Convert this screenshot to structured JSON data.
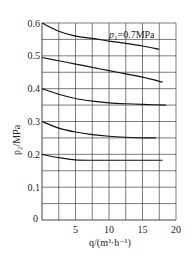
{
  "chart_data": {
    "type": "line",
    "title": "",
    "xlabel": "q/(m³·h⁻¹)",
    "ylabel": "p₂/MPa",
    "xlim": [
      0,
      20
    ],
    "ylim": [
      0,
      0.6
    ],
    "grid": true,
    "x_grid_step": 2.5,
    "y_grid_step": 0.05,
    "x_ticks": [
      {
        "value": 0,
        "label": "0"
      },
      {
        "value": 5,
        "label": "5"
      },
      {
        "value": 10,
        "label": "10"
      },
      {
        "value": 15,
        "label": "15"
      },
      {
        "value": 20,
        "label": "20"
      }
    ],
    "y_ticks": [
      {
        "value": 0.1,
        "label": "0.1"
      },
      {
        "value": 0.2,
        "label": "0.2"
      },
      {
        "value": 0.3,
        "label": "0.3"
      },
      {
        "value": 0.4,
        "label": "0.4"
      },
      {
        "value": 0.5,
        "label": "0.5"
      },
      {
        "value": 0.6,
        "label": "0.6"
      }
    ],
    "annotation": {
      "text_prefix": "p",
      "text_sub": "1",
      "text_suffix": "=0.7MPa",
      "x": 12.5,
      "y": 0.575
    },
    "series": [
      {
        "name": "p2 start 0.6",
        "x": [
          0,
          2.5,
          5,
          7.5,
          10,
          12.5,
          15,
          17.5
        ],
        "y": [
          0.6,
          0.575,
          0.56,
          0.553,
          0.545,
          0.538,
          0.53,
          0.52
        ]
      },
      {
        "name": "p2 start 0.5",
        "x": [
          0,
          2.5,
          5,
          7.5,
          10,
          12.5,
          15,
          18
        ],
        "y": [
          0.495,
          0.485,
          0.475,
          0.465,
          0.455,
          0.445,
          0.435,
          0.42
        ]
      },
      {
        "name": "p2 start 0.4",
        "x": [
          0,
          2.5,
          5,
          7.5,
          10,
          12.5,
          15,
          18.5
        ],
        "y": [
          0.4,
          0.383,
          0.37,
          0.362,
          0.357,
          0.354,
          0.352,
          0.35
        ]
      },
      {
        "name": "p2 start 0.3",
        "x": [
          0,
          2.5,
          5,
          7.5,
          10,
          12.5,
          15,
          17
        ],
        "y": [
          0.3,
          0.28,
          0.268,
          0.26,
          0.255,
          0.252,
          0.25,
          0.25
        ]
      },
      {
        "name": "p2 start 0.2",
        "x": [
          0,
          2.5,
          5,
          7.5,
          10,
          12.5,
          15,
          18
        ],
        "y": [
          0.2,
          0.19,
          0.183,
          0.182,
          0.182,
          0.182,
          0.182,
          0.182
        ]
      }
    ]
  }
}
